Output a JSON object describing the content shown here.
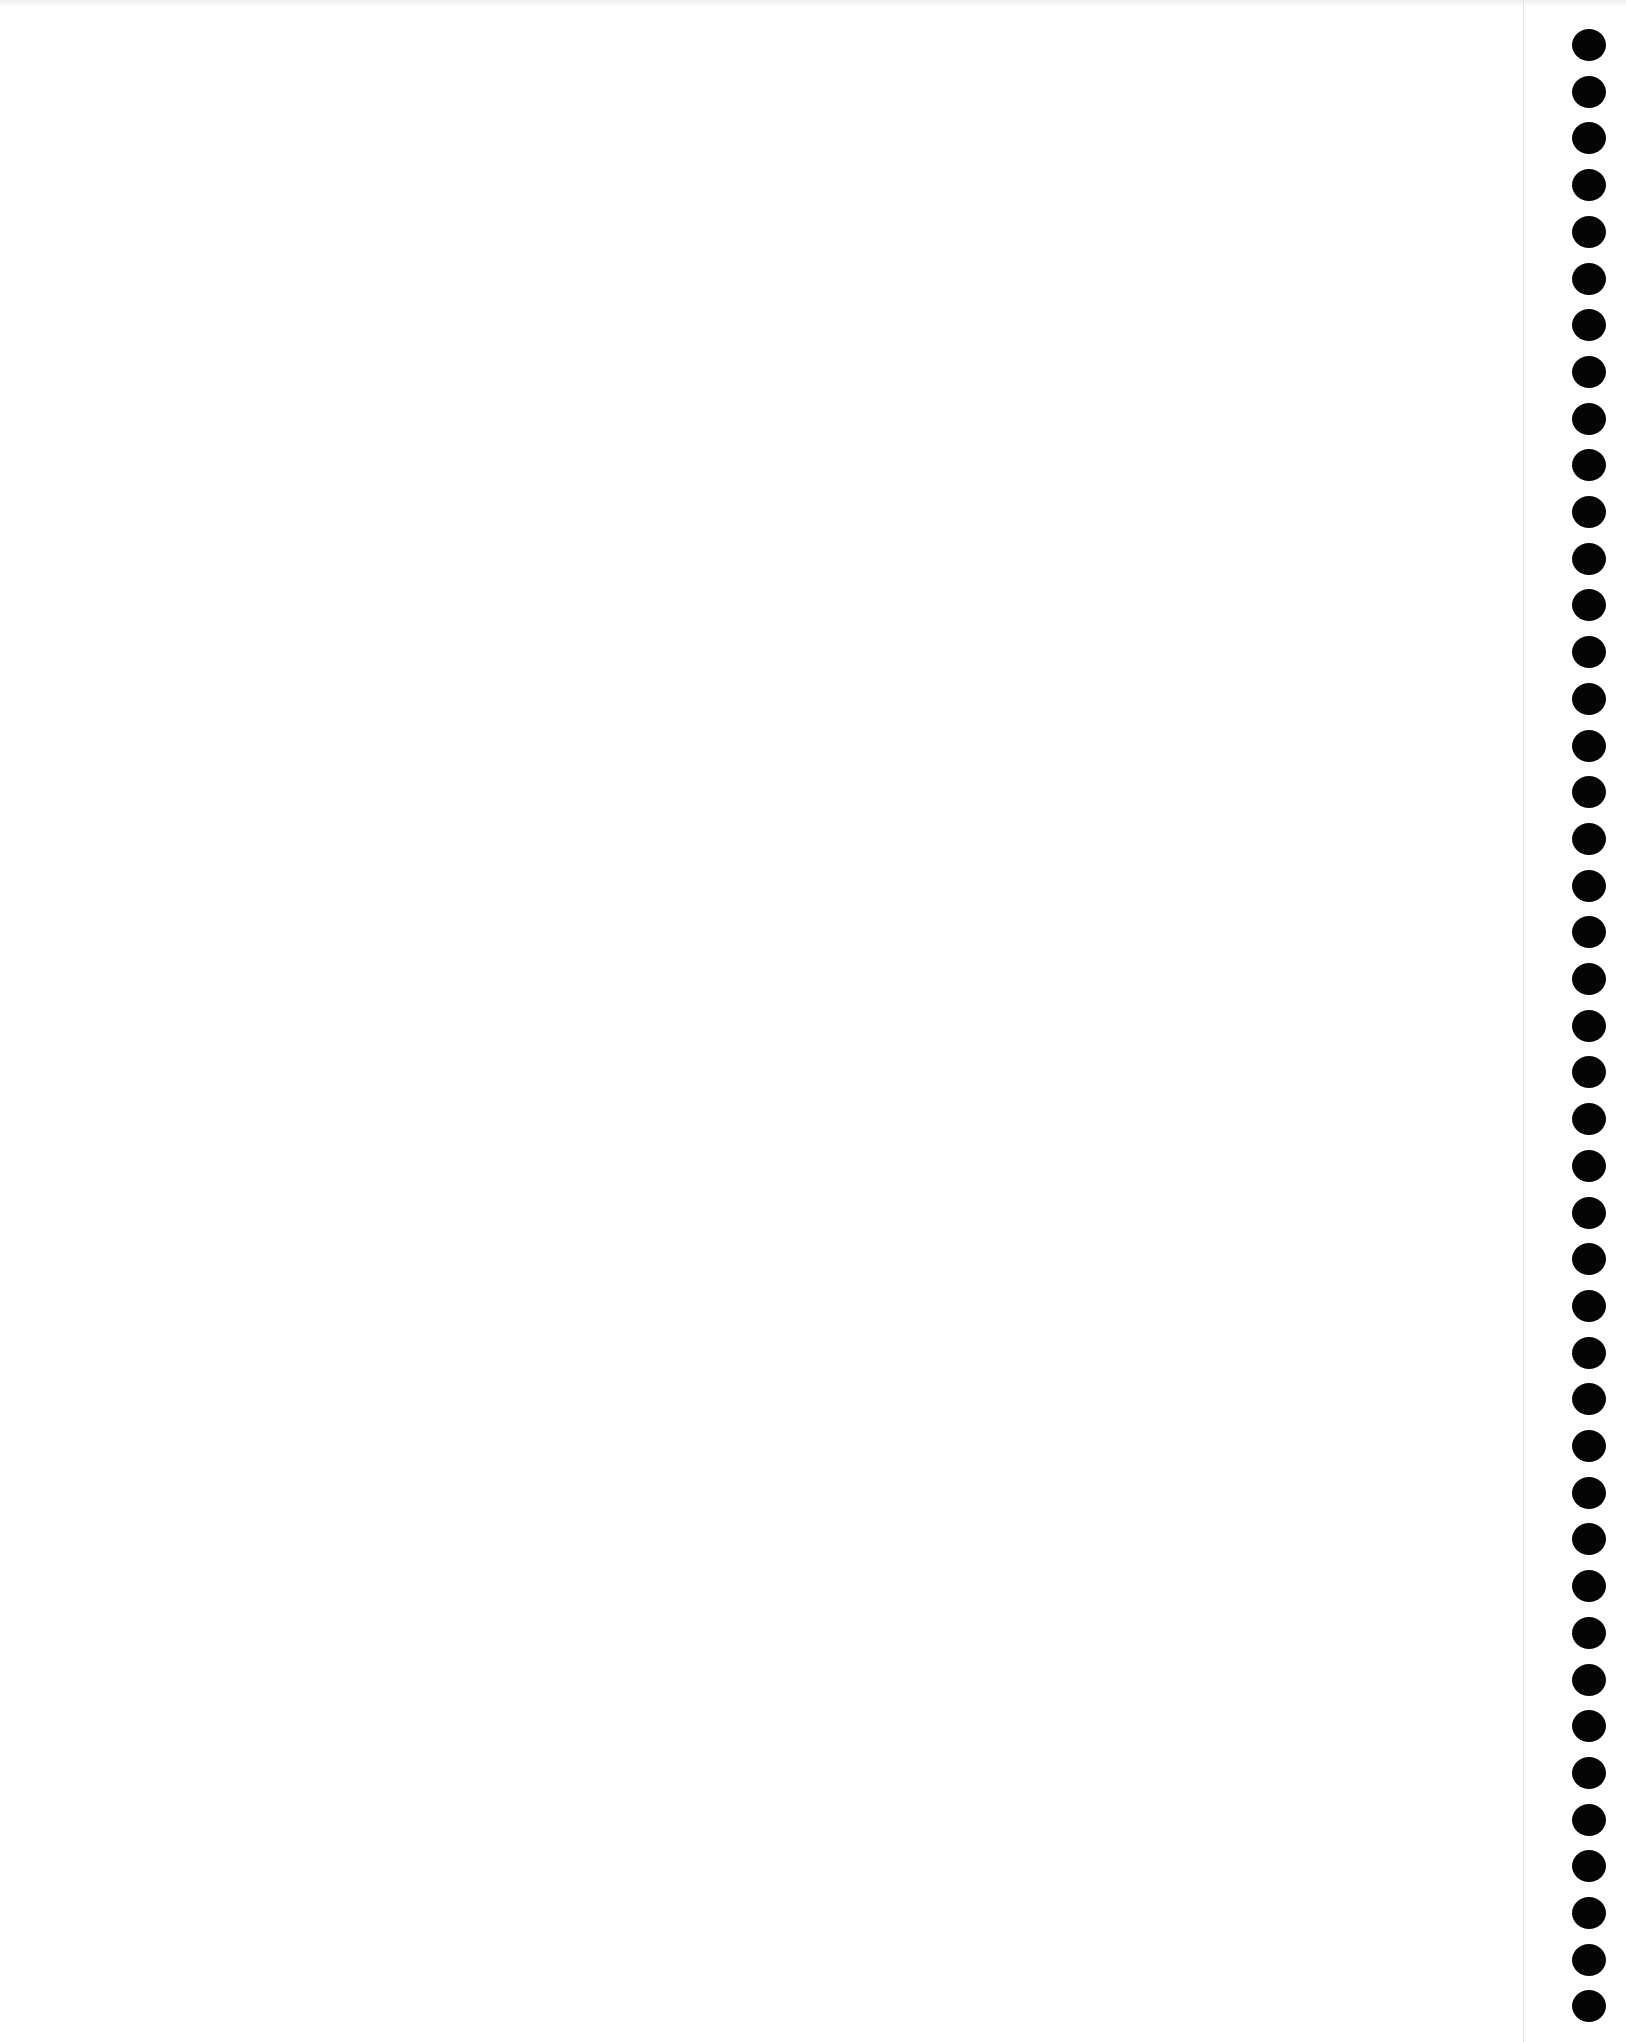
{
  "page": {
    "type": "blank notebook page",
    "background_color": "#ffffff",
    "text_content": ""
  },
  "binding": {
    "side": "right",
    "hole_count": 43,
    "hole_color": "#050505",
    "first_hole_y": 45,
    "hole_pitch": 46.7
  }
}
